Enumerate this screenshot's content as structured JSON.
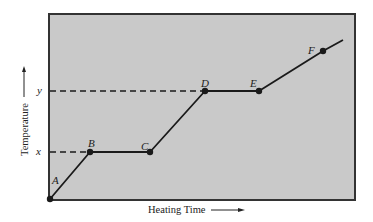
{
  "diagram": {
    "type": "heating-curve",
    "axes": {
      "x_label": "Heating Time",
      "y_label": "Temperature"
    },
    "reference_levels": [
      {
        "label": "y"
      },
      {
        "label": "x"
      }
    ],
    "points": [
      {
        "label": "A"
      },
      {
        "label": "B"
      },
      {
        "label": "C"
      },
      {
        "label": "D"
      },
      {
        "label": "E"
      },
      {
        "label": "F"
      }
    ],
    "colors": {
      "plot_fill": "#c9c9c9",
      "line": "#1a1a1a",
      "frame": "#333333",
      "text": "#222222"
    }
  }
}
